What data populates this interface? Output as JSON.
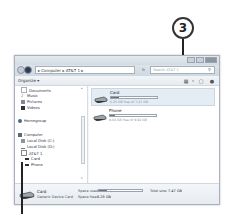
{
  "callout": {
    "number": "3"
  },
  "window": {
    "controls": [
      "minimize",
      "maximize",
      "close"
    ],
    "address": {
      "path": [
        "Computer",
        "AT&T 1"
      ],
      "display": "▸ Computer ▸ AT&T 1 ▸"
    },
    "refresh_label": "↻",
    "search": {
      "placeholder": "Search AT&T 1"
    },
    "toolbar": {
      "organize_label": "Organize ▾",
      "icons": [
        "view-icon",
        "preview-pane-icon",
        "help-icon"
      ]
    }
  },
  "nav": {
    "items": [
      {
        "label": "Documents",
        "icon": "documents-icon",
        "top": 2
      },
      {
        "label": "Music",
        "icon": "music-icon",
        "top": 8
      },
      {
        "label": "Pictures",
        "icon": "pictures-icon",
        "top": 14
      },
      {
        "label": "Videos",
        "icon": "videos-icon",
        "top": 20
      },
      {
        "label": "Homegroup",
        "icon": "homegroup-icon",
        "top": 33
      },
      {
        "label": "Computer",
        "icon": "computer-icon",
        "top": 47
      },
      {
        "label": "Local Disk (C:)",
        "icon": "disk-icon",
        "top": 53
      },
      {
        "label": "Local Disk (D:)",
        "icon": "disk-icon",
        "top": 59
      },
      {
        "label": "AT&T 1",
        "icon": "phone-icon",
        "top": 65
      },
      {
        "label": "Card",
        "icon": "drive-icon",
        "top": 71
      },
      {
        "label": "Phone",
        "icon": "drive-icon",
        "top": 77
      }
    ]
  },
  "content": {
    "drives": [
      {
        "name": "Card",
        "free_text": "6.25 GB free of 7.47 GB",
        "used_percent": 16,
        "selected": true
      },
      {
        "name": "Phone",
        "free_text": "9.64 GB free of 9.92 GB",
        "used_percent": 3,
        "selected": false
      }
    ]
  },
  "details": {
    "name": "Card",
    "type": "Generic Device Card",
    "space_used_label": "Space used:",
    "space_free_label": "Space free:",
    "space_free_value": "6.25 GB",
    "total_size_label": "Total size:",
    "total_size_value": "7.47 GB"
  }
}
